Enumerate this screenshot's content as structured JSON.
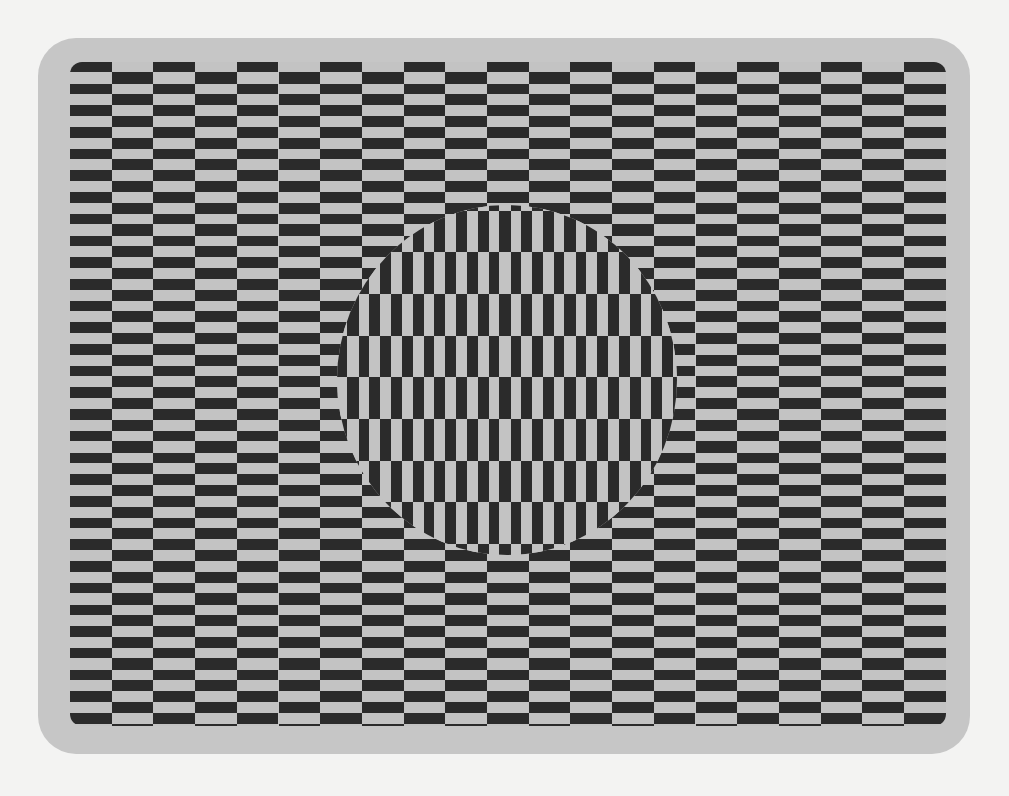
{
  "illusion": {
    "title": "",
    "colors": {
      "background": "#f3f3f2",
      "frame": "#c6c6c6",
      "dark": "#2b2b2b",
      "light": "#c3c3c3"
    },
    "outer_pattern": {
      "orientation": "horizontal-bars",
      "columns": 21,
      "column_width_px": 41.7,
      "stripe_period_px": 21.7
    },
    "inner_disc": {
      "orientation": "vertical-bars",
      "bands": 9,
      "band_height_px": 41.7,
      "stripe_period_px": 21.7,
      "center": [
        507,
        380
      ],
      "radius_x": 170,
      "radius_y": 175
    }
  }
}
